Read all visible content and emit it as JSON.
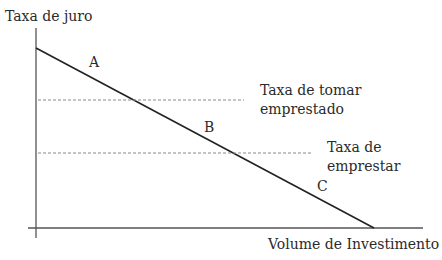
{
  "diagram": {
    "y_axis_label": "Taxa de juro",
    "x_axis_label": "Volume de Investimento",
    "points": {
      "a": "A",
      "b": "B",
      "c": "C"
    },
    "upper_rate": {
      "line1": "Taxa de tomar",
      "line2": "emprestado"
    },
    "lower_rate": {
      "line1": "Taxa de",
      "line2": "emprestar"
    },
    "colors": {
      "axis": "#555555",
      "curve": "#222222",
      "dashed": "#888888"
    }
  }
}
